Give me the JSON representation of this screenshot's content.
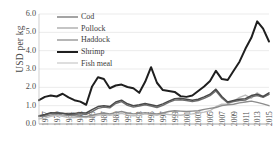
{
  "chart_data": {
    "type": "line",
    "title": "",
    "xlabel": "",
    "ylabel": "USD per kg",
    "ylim": [
      0.0,
      6.0
    ],
    "ytick_labels": [
      "0.0",
      "1.0",
      "2.0",
      "3.0",
      "4.0",
      "5.0",
      "6.0"
    ],
    "ytick_values": [
      0.0,
      1.0,
      2.0,
      3.0,
      4.0,
      5.0,
      6.0
    ],
    "grid": true,
    "legend_position": "upper-left-inside",
    "x": [
      1977,
      1978,
      1979,
      1980,
      1981,
      1982,
      1983,
      1984,
      1985,
      1986,
      1987,
      1988,
      1989,
      1990,
      1991,
      1992,
      1993,
      1994,
      1995,
      1996,
      1997,
      1998,
      1999,
      2000,
      2001,
      2002,
      2003,
      2004,
      2005,
      2006,
      2007,
      2008,
      2009,
      2010,
      2011,
      2012,
      2013,
      2014,
      2015,
      2016
    ],
    "xtick_labels": [
      "1977",
      "1979",
      "1981",
      "1983",
      "1985",
      "1987",
      "1989",
      "1991",
      "1993",
      "1995",
      "1997",
      "1999",
      "2001",
      "2003",
      "2005",
      "2007",
      "2009",
      "2011",
      "2013",
      "2015"
    ],
    "series": [
      {
        "name": "Cod",
        "color": "#4a4a4a",
        "width": 1.5,
        "values": [
          0.45,
          0.52,
          0.62,
          0.6,
          0.58,
          0.55,
          0.58,
          0.62,
          0.6,
          0.78,
          0.95,
          1.0,
          0.95,
          1.2,
          1.3,
          1.1,
          1.0,
          1.05,
          1.12,
          1.05,
          0.98,
          1.1,
          1.25,
          1.38,
          1.4,
          1.35,
          1.3,
          1.35,
          1.48,
          1.62,
          1.9,
          1.5,
          1.2,
          1.28,
          1.35,
          1.38,
          1.55,
          1.62,
          1.5,
          1.7
        ]
      },
      {
        "name": "Pollock",
        "color": "#8c8c8c",
        "width": 1.4,
        "values": [
          0.4,
          0.42,
          0.5,
          0.55,
          0.5,
          0.46,
          0.45,
          0.42,
          0.4,
          0.48,
          0.55,
          0.6,
          0.55,
          0.62,
          0.68,
          0.6,
          0.55,
          0.58,
          0.62,
          0.58,
          0.55,
          0.6,
          0.68,
          0.72,
          0.7,
          0.68,
          0.7,
          0.72,
          0.8,
          0.85,
          0.9,
          1.0,
          1.05,
          1.08,
          1.15,
          1.2,
          1.25,
          1.18,
          1.1,
          1.0
        ]
      },
      {
        "name": "Haddock",
        "color": "#6e6e6e",
        "width": 1.4,
        "values": [
          0.42,
          0.48,
          0.58,
          0.62,
          0.58,
          0.52,
          0.52,
          0.55,
          0.52,
          0.68,
          0.85,
          0.92,
          0.88,
          1.12,
          1.22,
          1.02,
          0.92,
          0.98,
          1.05,
          0.98,
          0.9,
          1.02,
          1.18,
          1.3,
          1.32,
          1.28,
          1.22,
          1.28,
          1.4,
          1.55,
          1.8,
          1.42,
          1.15,
          1.22,
          1.28,
          1.3,
          1.48,
          1.55,
          1.45,
          1.62
        ]
      },
      {
        "name": "Shrimp",
        "color": "#1f1f1f",
        "width": 2.0,
        "values": [
          1.3,
          1.48,
          1.55,
          1.5,
          1.65,
          1.45,
          1.3,
          1.22,
          1.05,
          2.05,
          2.55,
          2.45,
          1.95,
          2.1,
          2.15,
          2.02,
          1.95,
          1.7,
          2.3,
          3.1,
          2.25,
          1.85,
          1.8,
          1.75,
          1.52,
          1.48,
          1.55,
          1.8,
          2.05,
          2.35,
          2.9,
          2.45,
          2.4,
          2.9,
          3.4,
          4.1,
          4.7,
          5.6,
          5.2,
          4.5
        ]
      },
      {
        "name": "Fish meal",
        "color": "#bdbdbd",
        "width": 1.4,
        "values": [
          0.28,
          0.32,
          0.42,
          0.48,
          0.42,
          0.35,
          0.35,
          0.38,
          0.35,
          0.42,
          0.48,
          0.52,
          0.48,
          0.52,
          0.58,
          0.5,
          0.45,
          0.48,
          0.55,
          0.52,
          0.48,
          0.55,
          0.52,
          0.5,
          0.48,
          0.52,
          0.55,
          0.6,
          0.65,
          0.72,
          0.95,
          1.08,
          1.1,
          1.25,
          1.45,
          1.58,
          1.4,
          1.7,
          1.5,
          1.62
        ]
      }
    ]
  },
  "legend": {
    "items": [
      {
        "label": "Cod"
      },
      {
        "label": "Pollock"
      },
      {
        "label": "Haddock"
      },
      {
        "label": "Shrimp"
      },
      {
        "label": "Fish meal"
      }
    ]
  }
}
